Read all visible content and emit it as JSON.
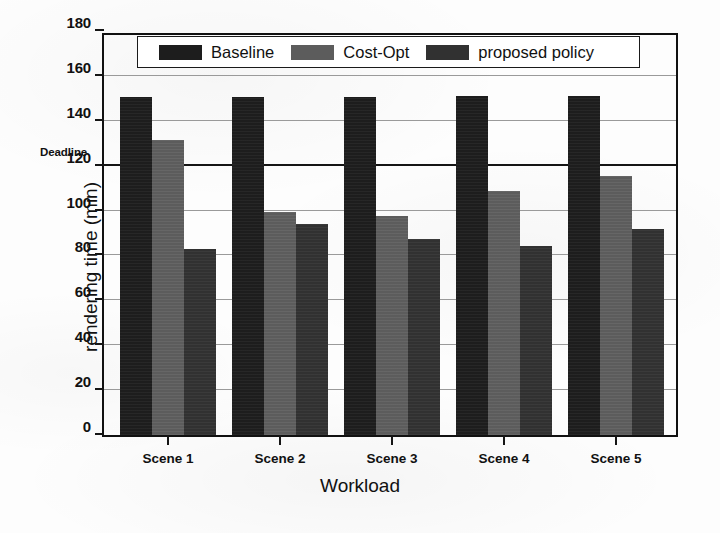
{
  "chart_data": {
    "type": "bar",
    "title": "",
    "xlabel": "Workload",
    "ylabel": "rendering time (min)",
    "categories": [
      "Scene 1",
      "Scene 2",
      "Scene 3",
      "Scene 4",
      "Scene 5"
    ],
    "series": [
      {
        "name": "Baseline",
        "color": "#1d1d1d",
        "values": [
          150.5,
          150.5,
          150.5,
          151,
          151
        ]
      },
      {
        "name": "Cost-Opt",
        "color": "#5c5c5c",
        "values": [
          131.5,
          99.5,
          97.5,
          108.5,
          115.5
        ]
      },
      {
        "name": "proposed policy",
        "color": "#313131",
        "values": [
          83,
          94,
          87.5,
          84,
          92
        ]
      }
    ],
    "ylim": [
      0,
      180
    ],
    "yticks": [
      0,
      20,
      40,
      60,
      80,
      100,
      120,
      140,
      160,
      180
    ],
    "ytick_labels": [
      "0",
      "20",
      "40",
      "60",
      "80",
      "100",
      "120",
      "140",
      "160",
      "180"
    ],
    "grid": true,
    "legend_position": "upper center",
    "annotations": [
      {
        "text": "Deadline",
        "y": 120,
        "style": "bold",
        "placement": "left-of-axis-above-tick"
      }
    ],
    "reference_lines": [
      {
        "name": "deadline",
        "y": 120,
        "color": "#151515"
      }
    ]
  },
  "legend": {
    "entries": [
      {
        "label": "Baseline"
      },
      {
        "label": "Cost-Opt"
      },
      {
        "label": "proposed policy"
      }
    ]
  },
  "axes": {
    "y_title": "rendering time (min)",
    "x_title": "Workload",
    "deadline_label": "Deadline"
  }
}
